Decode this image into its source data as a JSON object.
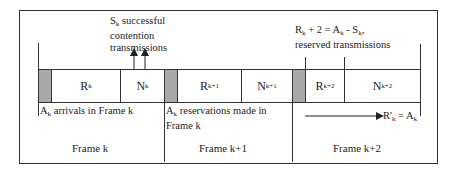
{
  "diagram": {
    "type": "frame-timeline",
    "slots": [
      {
        "id": "gray-1",
        "label": "",
        "kind": "control"
      },
      {
        "id": "Rk",
        "base": "R",
        "sub": "k",
        "kind": "reserved"
      },
      {
        "id": "Nk",
        "base": "N",
        "sub": "k",
        "kind": "contention"
      },
      {
        "id": "gray-2",
        "label": "",
        "kind": "control"
      },
      {
        "id": "Rk1",
        "base": "R",
        "sub": "k+1",
        "kind": "reserved"
      },
      {
        "id": "Nk1",
        "base": "N",
        "sub": "k+1",
        "kind": "contention"
      },
      {
        "id": "gray-3",
        "label": "",
        "kind": "control"
      },
      {
        "id": "Rk2",
        "base": "R",
        "sub": "k+2",
        "kind": "reserved"
      },
      {
        "id": "Nk2",
        "base": "N",
        "sub": "k+2",
        "kind": "contention"
      }
    ],
    "annotations": {
      "sk": {
        "base": "S",
        "sub": "k",
        "line1_rest": " successful",
        "line2": "contention",
        "line3": "transmissions"
      },
      "rk2": {
        "line1": "R",
        "line1_sub": "k",
        "line1_rest": " + 2 = A",
        "line1_sub2": "k",
        "line1_rest2": " - S",
        "line1_sub3": "k",
        "line1_end": ",",
        "line2": "reserved transmissions"
      },
      "ak_arrivals": {
        "base": "A",
        "sub": "k",
        "rest": " arrivals in Frame k"
      },
      "ak_reservations": {
        "base": "A",
        "sub": "k",
        "rest": " reservations made in",
        "line2": "Frame k"
      },
      "rprime": {
        "base": "R'",
        "sub": "k",
        "rest": " = A",
        "sub2": "k"
      }
    },
    "frames": [
      {
        "label": "Frame k"
      },
      {
        "label": "Frame k+1"
      },
      {
        "label": "Frame k+2"
      }
    ],
    "colors": {
      "line": "#333333",
      "control_slot": "#a9a9a9",
      "background": "#ffffff"
    }
  }
}
